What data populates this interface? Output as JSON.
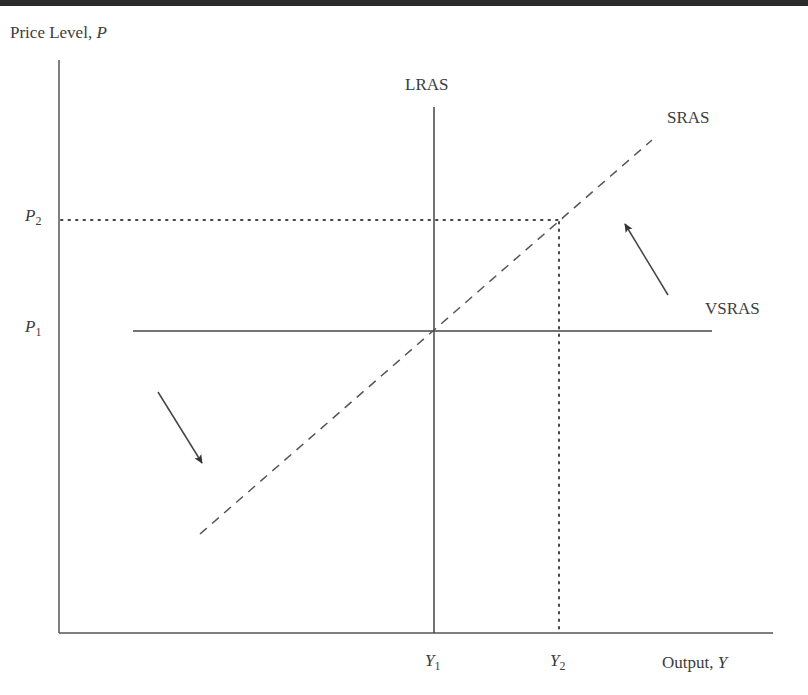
{
  "diagram": {
    "type": "economics-aggregate-supply",
    "y_axis": {
      "label": "Price Level, ",
      "variable": "P"
    },
    "x_axis": {
      "label": "Output, ",
      "variable": "Y"
    },
    "price_levels": [
      {
        "symbol": "P",
        "subscript": "1"
      },
      {
        "symbol": "P",
        "subscript": "2"
      }
    ],
    "output_levels": [
      {
        "symbol": "Y",
        "subscript": "1"
      },
      {
        "symbol": "Y",
        "subscript": "2"
      }
    ],
    "curves": [
      {
        "name": "LRAS",
        "label": "LRAS",
        "style": "solid",
        "orientation": "vertical",
        "at": "Y1"
      },
      {
        "name": "SRAS",
        "label": "SRAS",
        "style": "dashed",
        "orientation": "upward-sloping"
      },
      {
        "name": "VSRAS",
        "label": "VSRAS",
        "style": "solid",
        "orientation": "horizontal",
        "at": "P1"
      }
    ],
    "guides": [
      {
        "style": "dotted",
        "from": "P2",
        "to": "SRAS at Y2"
      },
      {
        "style": "dotted",
        "from": "Y2",
        "to": "SRAS at P2"
      }
    ],
    "arrows": [
      {
        "direction": "up-left",
        "meaning": "rotation toward SRAS above VSRAS"
      },
      {
        "direction": "down-right",
        "meaning": "rotation toward SRAS below VSRAS"
      }
    ],
    "colors": {
      "line": "#444444",
      "text": "#3d3d3d",
      "top_band": "#2a2a2a"
    }
  }
}
